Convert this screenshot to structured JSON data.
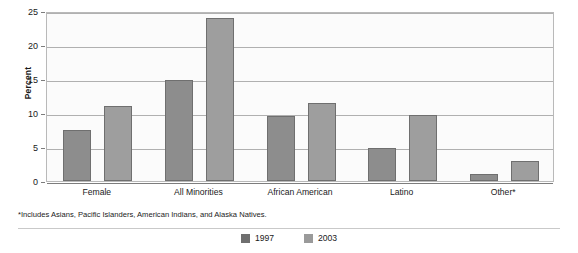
{
  "chart_data": {
    "type": "bar",
    "title": "",
    "xlabel": "",
    "ylabel": "Percent",
    "ylim": [
      0,
      25
    ],
    "yticks": [
      0,
      5,
      10,
      15,
      20,
      25
    ],
    "grid": true,
    "legend_position": "bottom-center",
    "categories": [
      "Female",
      "All Minorities",
      "African American",
      "Latino",
      "Other*"
    ],
    "series": [
      {
        "name": "1997",
        "color": "#8d8d8d",
        "values": [
          7.5,
          14.8,
          9.5,
          4.8,
          1.1
        ]
      },
      {
        "name": "2003",
        "color": "#9e9e9e",
        "values": [
          11.0,
          24.0,
          11.5,
          9.7,
          3.0
        ]
      }
    ],
    "footnote": "*Includes Asians, Pacific Islanders, American Indians, and Alaska Natives."
  },
  "axis": {
    "tick_0": "0",
    "tick_5": "5",
    "tick_10": "10",
    "tick_15": "15",
    "tick_20": "20",
    "tick_25": "25"
  },
  "categories": {
    "c0": "Female",
    "c1": "All Minorities",
    "c2": "African American",
    "c3": "Latino",
    "c4": "Other*"
  },
  "legend": {
    "item_1997": "1997",
    "item_2003": "2003"
  }
}
